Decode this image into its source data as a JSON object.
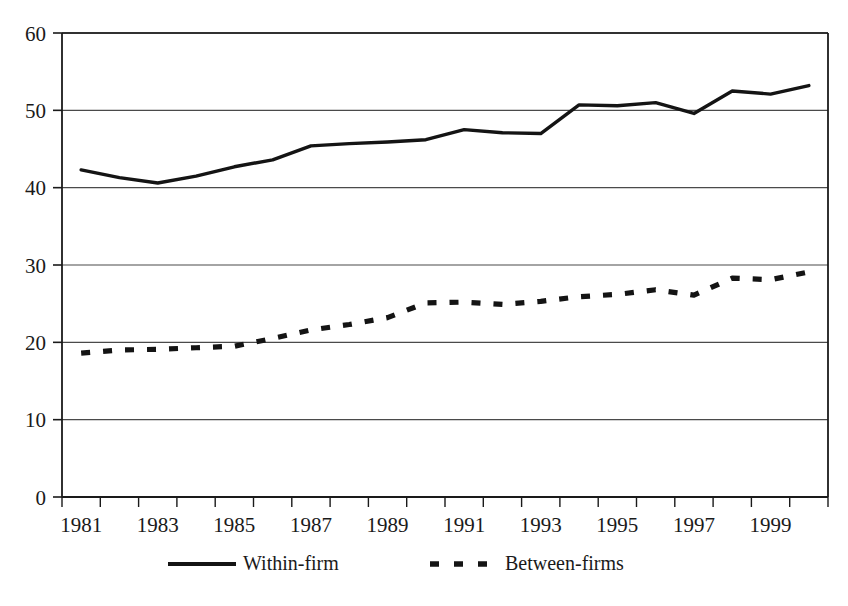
{
  "chart_data": {
    "type": "line",
    "title": "",
    "subtitle": "",
    "xlabel": "",
    "ylabel": "",
    "xlim": [
      1980.5,
      2000.5
    ],
    "ylim": [
      0,
      60
    ],
    "grid": true,
    "grid_axis": "y",
    "legend_position": "bottom",
    "x": [
      1981,
      1982,
      1983,
      1984,
      1985,
      1986,
      1987,
      1988,
      1989,
      1990,
      1991,
      1992,
      1993,
      1994,
      1995,
      1996,
      1997,
      1998,
      1999,
      2000
    ],
    "x_tick_labels": [
      "1981",
      "1983",
      "1985",
      "1987",
      "1989",
      "1991",
      "1993",
      "1995",
      "1997",
      "1999"
    ],
    "x_tick_values": [
      1981,
      1983,
      1985,
      1987,
      1989,
      1991,
      1993,
      1995,
      1997,
      1999
    ],
    "y_tick_labels": [
      "0",
      "10",
      "20",
      "30",
      "40",
      "50",
      "60"
    ],
    "y_tick_values": [
      0,
      10,
      20,
      30,
      40,
      50,
      60
    ],
    "series": [
      {
        "name": "Within-firm",
        "style": "solid",
        "color": "#141414",
        "values": [
          42.3,
          41.3,
          40.6,
          41.5,
          42.7,
          43.6,
          45.4,
          45.7,
          45.9,
          46.2,
          47.5,
          47.1,
          47.0,
          50.7,
          50.6,
          51.0,
          49.6,
          52.5,
          52.1,
          53.2
        ]
      },
      {
        "name": "Between-firms",
        "style": "dashed",
        "color": "#141414",
        "values": [
          18.6,
          19.0,
          19.1,
          19.3,
          19.5,
          20.5,
          21.6,
          22.3,
          23.2,
          25.1,
          25.2,
          24.9,
          25.3,
          25.9,
          26.2,
          26.8,
          26.1,
          28.3,
          28.1,
          29.1
        ]
      }
    ]
  },
  "legend": {
    "items": [
      {
        "label": "Within-firm",
        "style": "solid"
      },
      {
        "label": "Between-firms",
        "style": "dashed"
      }
    ]
  },
  "axes": {
    "y_max_label": "60",
    "y_min_label": "0"
  }
}
